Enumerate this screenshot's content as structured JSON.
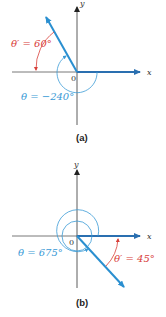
{
  "colors": {
    "terminal_ray": "#2a8fd0",
    "reference_angle": "#d8403a",
    "theta": "#3a9ad6",
    "axis": "#444444"
  },
  "panel_a": {
    "caption": "(a)",
    "x_label": "x",
    "y_label": "y",
    "origin_label": "0",
    "reference_angle_label": "θ′ = 60°",
    "theta_label": "θ = −240°"
  },
  "panel_b": {
    "caption": "(b)",
    "x_label": "x",
    "y_label": "y",
    "origin_label": "0",
    "reference_angle_label": "θ′ = 45°",
    "theta_label": "θ = 675°"
  }
}
